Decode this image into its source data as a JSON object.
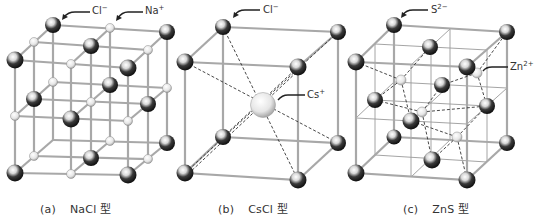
{
  "figure": {
    "panels": [
      {
        "id": "a",
        "index_label": "(a)",
        "name": "NaCl 型",
        "structure": "NaCl",
        "ion_labels": [
          {
            "text": "Cl",
            "charge": "−",
            "points_to": "large-dark-sphere"
          },
          {
            "text": "Na",
            "charge": "+",
            "points_to": "small-light-sphere"
          }
        ]
      },
      {
        "id": "b",
        "index_label": "(b)",
        "name": "CsCl 型",
        "structure": "CsCl",
        "ion_labels": [
          {
            "text": "Cl",
            "charge": "−",
            "points_to": "corner-sphere"
          },
          {
            "text": "Cs",
            "charge": "+",
            "points_to": "center-sphere"
          }
        ]
      },
      {
        "id": "c",
        "index_label": "(c)",
        "name": "ZnS 型",
        "structure": "ZnS",
        "ion_labels": [
          {
            "text": "S",
            "charge": "2−",
            "points_to": "dark-sphere"
          },
          {
            "text": "Zn",
            "charge": "2+",
            "points_to": "small-light-sphere"
          }
        ]
      }
    ]
  },
  "colors": {
    "bond": "#a8a8a8",
    "dashed_bond": "#333333",
    "anion_dark": "#111111",
    "anion_highlight": "#ffffff",
    "cation_light": "#dcdcdc",
    "text": "#333333"
  }
}
